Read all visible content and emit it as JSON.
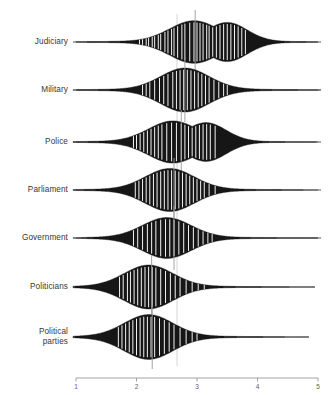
{
  "chart_data": {
    "type": "violin",
    "title": "",
    "xlabel": "",
    "ylabel": "",
    "xlim": [
      1,
      5
    ],
    "xticks": [
      1,
      2,
      3,
      4,
      5
    ],
    "xtick_labels": [
      "1",
      "2",
      "3",
      "4",
      "5"
    ],
    "grid": false,
    "legend": "none",
    "orientation": "horizontal",
    "reference_line": 2.67,
    "categories": [
      "Judiciary",
      "Military",
      "Police",
      "Parliament",
      "Government",
      "Politicians",
      "Political parties"
    ],
    "series": [
      {
        "name": "Judiciary",
        "median": 2.97,
        "mode": 2.95,
        "range": [
          1.2,
          4.8
        ],
        "density_peak": 0.97,
        "bimodal": true,
        "rug_values": [
          2.05,
          2.1,
          2.16,
          2.2,
          2.26,
          2.3,
          2.36,
          2.4,
          2.47,
          2.52,
          2.58,
          2.62,
          2.68,
          2.75,
          2.8,
          2.88,
          2.95,
          3.0,
          3.05,
          3.1,
          3.16,
          3.2,
          3.26,
          3.32,
          3.38,
          3.44,
          3.5,
          3.56,
          3.62,
          3.68,
          3.74,
          3.8
        ]
      },
      {
        "name": "Military",
        "median": 2.8,
        "mode": 2.8,
        "range": [
          1.05,
          4.9
        ],
        "density_peak": 1.0,
        "bimodal": false,
        "rug_values": [
          2.1,
          2.16,
          2.22,
          2.3,
          2.38,
          2.45,
          2.52,
          2.6,
          2.66,
          2.72,
          2.78,
          2.84,
          2.9,
          2.96,
          3.02,
          3.08,
          3.14,
          3.2,
          3.28,
          3.36,
          3.44,
          3.5
        ]
      },
      {
        "name": "Police",
        "median": 2.74,
        "mode": 2.6,
        "range": [
          1.0,
          4.85
        ],
        "density_peak": 0.96,
        "bimodal": true,
        "rug_values": [
          1.95,
          2.0,
          2.06,
          2.12,
          2.18,
          2.24,
          2.3,
          2.36,
          2.42,
          2.5,
          2.58,
          2.66,
          2.74,
          2.8,
          2.86,
          2.92,
          2.98,
          3.04,
          3.1,
          3.16,
          3.22,
          3.3
        ]
      },
      {
        "name": "Parliament",
        "median": 2.62,
        "mode": 2.55,
        "range": [
          1.05,
          4.6
        ],
        "density_peak": 0.98,
        "bimodal": false,
        "rug_values": [
          1.98,
          2.04,
          2.1,
          2.16,
          2.22,
          2.28,
          2.34,
          2.4,
          2.46,
          2.52,
          2.58,
          2.64,
          2.7,
          2.76,
          2.82,
          2.88,
          2.94,
          3.0,
          3.06,
          3.12,
          3.2,
          3.3
        ]
      },
      {
        "name": "Government",
        "median": 2.62,
        "mode": 2.5,
        "range": [
          1.2,
          4.95
        ],
        "density_peak": 0.93,
        "bimodal": false,
        "rug_values": [
          1.95,
          2.02,
          2.1,
          2.18,
          2.25,
          2.32,
          2.4,
          2.48,
          2.55,
          2.62,
          2.7,
          2.78,
          2.86,
          2.94,
          3.02,
          3.1,
          3.18,
          3.25
        ]
      },
      {
        "name": "Politicians",
        "median": 2.25,
        "mode": 2.2,
        "range": [
          1.0,
          4.4
        ],
        "density_peak": 1.0,
        "bimodal": false,
        "rug_values": [
          1.72,
          1.78,
          1.85,
          1.9,
          1.96,
          2.02,
          2.08,
          2.14,
          2.2,
          2.26,
          2.32,
          2.4,
          2.48,
          2.56,
          2.64,
          2.72,
          2.82,
          2.92,
          3.02,
          3.12
        ]
      },
      {
        "name": "Political parties",
        "median": 2.26,
        "mode": 2.2,
        "range": [
          1.0,
          4.3
        ],
        "density_peak": 1.02,
        "bimodal": false,
        "rug_values": [
          1.7,
          1.76,
          1.82,
          1.88,
          1.94,
          2.0,
          2.06,
          2.12,
          2.18,
          2.24,
          2.3,
          2.38,
          2.46,
          2.54,
          2.62,
          2.72,
          2.82,
          2.92,
          3.0
        ]
      }
    ],
    "colors": {
      "fill": "#161616",
      "rug": "#ffffff",
      "axis": "#8a8a8a",
      "reference_line": "#cccccc",
      "median_line": "#9a9a9a",
      "text": "#363636"
    }
  }
}
